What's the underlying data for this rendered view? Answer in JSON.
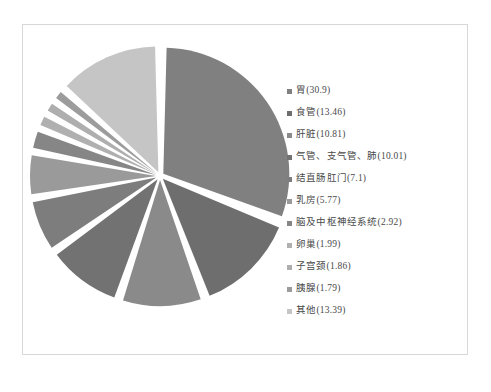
{
  "chart_data": {
    "type": "pie",
    "title": "",
    "subtitle": "",
    "xlabel": "",
    "ylabel": "",
    "legend_position": "right",
    "grid": false,
    "exploded": true,
    "start_angle_deg": 0,
    "direction": "clockwise",
    "categories": [
      "胃",
      "食管",
      "肝脏",
      "气管、支气管、肺",
      "结直肠肛门",
      "乳房",
      "脑及中枢神经系统",
      "卵巢",
      "子宫颈",
      "胰腺",
      "其他"
    ],
    "values": [
      30.9,
      13.46,
      10.81,
      10.01,
      7.1,
      5.77,
      2.92,
      1.99,
      1.86,
      1.79,
      13.39
    ],
    "colors": [
      "#808080",
      "#6e6e6e",
      "#8a8a8a",
      "#727272",
      "#7d7d7d",
      "#9a9a9a",
      "#868686",
      "#b0b0b0",
      "#aeaeae",
      "#9c9c9c",
      "#c5c5c5"
    ],
    "slices": [
      {
        "label": "胃",
        "value": 30.9,
        "display": "胃(30.9)",
        "color": "#808080"
      },
      {
        "label": "食管",
        "value": 13.46,
        "display": "食管(13.46)",
        "color": "#6e6e6e"
      },
      {
        "label": "肝脏",
        "value": 10.81,
        "display": "肝脏(10.81)",
        "color": "#8a8a8a"
      },
      {
        "label": "气管、支气管、肺",
        "value": 10.01,
        "display": "气管、支气管、肺(10.01)",
        "color": "#727272"
      },
      {
        "label": "结直肠肛门",
        "value": 7.1,
        "display": "结直肠肛门(7.1)",
        "color": "#7d7d7d"
      },
      {
        "label": "乳房",
        "value": 5.77,
        "display": "乳房(5.77)",
        "color": "#9a9a9a"
      },
      {
        "label": "脑及中枢神经系统",
        "value": 2.92,
        "display": "脑及中枢神经系统(2.92)",
        "color": "#868686"
      },
      {
        "label": "卵巢",
        "value": 1.99,
        "display": "卵巢(1.99)",
        "color": "#b0b0b0"
      },
      {
        "label": "子宫颈",
        "value": 1.86,
        "display": "子宫颈(1.86)",
        "color": "#aeaeae"
      },
      {
        "label": "胰腺",
        "value": 1.79,
        "display": "胰腺(1.79)",
        "color": "#9c9c9c"
      },
      {
        "label": "其他",
        "value": 13.39,
        "display": "其他(13.39)",
        "color": "#c5c5c5"
      }
    ]
  },
  "legend": {
    "entries": [
      {
        "marker": "legend-swatch-icon",
        "text": "胃(30.9)"
      },
      {
        "marker": "legend-swatch-icon",
        "text": "食管(13.46)"
      },
      {
        "marker": "legend-swatch-icon",
        "text": "肝脏(10.81)"
      },
      {
        "marker": "legend-swatch-icon",
        "text": "气管、支气管、肺(10.01)"
      },
      {
        "marker": "legend-swatch-icon",
        "text": "结直肠肛门(7.1)"
      },
      {
        "marker": "legend-swatch-icon",
        "text": "乳房(5.77)"
      },
      {
        "marker": "legend-swatch-icon",
        "text": "脑及中枢神经系统(2.92)"
      },
      {
        "marker": "legend-swatch-icon",
        "text": "卵巢(1.99)"
      },
      {
        "marker": "legend-swatch-icon",
        "text": "子宫颈(1.86)"
      },
      {
        "marker": "legend-swatch-icon",
        "text": "胰腺(1.79)"
      },
      {
        "marker": "legend-swatch-icon",
        "text": "其他(13.39)"
      }
    ]
  },
  "caption": {
    "text": ""
  },
  "frame": {
    "border_color": "#d8d8d8",
    "background": "#ffffff"
  }
}
